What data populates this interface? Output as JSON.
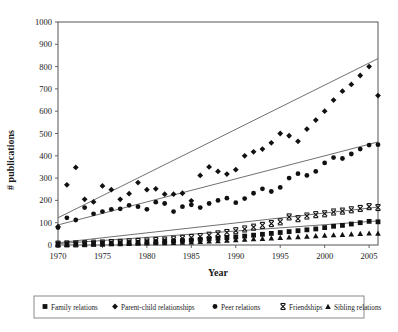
{
  "chart_data": {
    "type": "scatter",
    "title": "",
    "xlabel": "Year",
    "ylabel": "# publications",
    "xlim": [
      1970,
      2006
    ],
    "ylim": [
      0,
      1000
    ],
    "grid": false,
    "legend_position": "bottom",
    "xticks": [
      1970,
      1975,
      1980,
      1985,
      1990,
      1995,
      2000,
      2005
    ],
    "xtick_labels": [
      "1970",
      "1975",
      "1980",
      "1985",
      "1990",
      "1995",
      "2000",
      "2005"
    ],
    "yticks": [
      0,
      100,
      200,
      300,
      400,
      500,
      600,
      700,
      800,
      900,
      1000
    ],
    "ytick_labels": [
      "0",
      "100",
      "200",
      "300",
      "400",
      "500",
      "600",
      "700",
      "800",
      "900",
      "1000"
    ],
    "x": [
      1970,
      1971,
      1972,
      1973,
      1974,
      1975,
      1976,
      1977,
      1978,
      1979,
      1980,
      1981,
      1982,
      1983,
      1984,
      1985,
      1986,
      1987,
      1988,
      1989,
      1990,
      1991,
      1992,
      1993,
      1994,
      1995,
      1996,
      1997,
      1998,
      1999,
      2000,
      2001,
      2002,
      2003,
      2004,
      2005,
      2006
    ],
    "series": [
      {
        "name": "Family relations",
        "marker": "square",
        "color": "#111111",
        "trendline": {
          "x0": 1970,
          "y0": 6,
          "x1": 2006,
          "y1": 108
        },
        "values": [
          5,
          5,
          6,
          6,
          7,
          8,
          8,
          10,
          11,
          12,
          14,
          15,
          17,
          18,
          20,
          22,
          25,
          28,
          30,
          33,
          36,
          40,
          44,
          48,
          52,
          56,
          60,
          64,
          68,
          72,
          78,
          84,
          88,
          94,
          100,
          106,
          104
        ]
      },
      {
        "name": "Parent-child relationships",
        "marker": "diamond",
        "color": "#111111",
        "trendline": {
          "x0": 1970,
          "y0": 122,
          "x1": 2006,
          "y1": 836
        },
        "values": [
          82,
          270,
          348,
          205,
          193,
          265,
          248,
          205,
          230,
          280,
          248,
          252,
          228,
          228,
          232,
          198,
          312,
          350,
          330,
          318,
          338,
          400,
          418,
          430,
          458,
          500,
          490,
          465,
          520,
          560,
          600,
          650,
          690,
          720,
          760,
          800,
          670
        ]
      },
      {
        "name": "Peer relations",
        "marker": "circle",
        "color": "#111111",
        "trendline": {
          "x0": 1970,
          "y0": 90,
          "x1": 2006,
          "y1": 462
        },
        "values": [
          78,
          122,
          112,
          168,
          140,
          150,
          160,
          162,
          178,
          172,
          160,
          192,
          186,
          150,
          172,
          180,
          168,
          186,
          200,
          210,
          190,
          208,
          232,
          252,
          240,
          258,
          300,
          320,
          312,
          330,
          368,
          392,
          388,
          408,
          430,
          448,
          450
        ]
      },
      {
        "name": "Friendships",
        "marker": "cross",
        "color": "#111111",
        "trendline": {
          "x0": 1970,
          "y0": 10,
          "x1": 2006,
          "y1": 170
        },
        "values": [
          4,
          5,
          5,
          6,
          8,
          9,
          11,
          12,
          14,
          16,
          18,
          20,
          22,
          26,
          30,
          34,
          38,
          44,
          50,
          56,
          64,
          72,
          80,
          88,
          96,
          104,
          126,
          118,
          130,
          136,
          140,
          148,
          152,
          158,
          164,
          172,
          168
        ]
      },
      {
        "name": "Sibling relations",
        "marker": "triangle",
        "color": "#111111",
        "trendline": null,
        "values": [
          2,
          2,
          3,
          3,
          4,
          4,
          5,
          5,
          6,
          7,
          8,
          9,
          10,
          11,
          12,
          13,
          15,
          17,
          19,
          21,
          23,
          25,
          27,
          29,
          31,
          33,
          35,
          37,
          39,
          41,
          43,
          45,
          47,
          49,
          51,
          53,
          52
        ]
      }
    ]
  }
}
